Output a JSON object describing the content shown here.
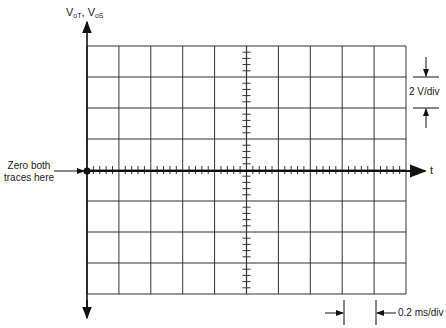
{
  "diagram": {
    "y_axis": {
      "label_main": "V",
      "sub1": "oT",
      "sep": ", V",
      "sub2": "oS"
    },
    "x_axis": {
      "label": "t"
    },
    "annotations": {
      "zero_line1": "Zero both",
      "zero_line2": "traces here",
      "vertical_scale": "2 V/div",
      "horizontal_scale": "0.2 ms/div"
    },
    "grid": {
      "columns": 10,
      "rows": 8,
      "line_color": "#333333",
      "trace_color": "#111111"
    }
  }
}
